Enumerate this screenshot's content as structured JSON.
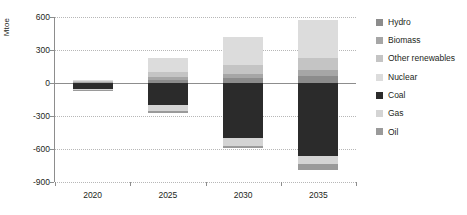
{
  "chart_data": {
    "type": "bar",
    "title": "",
    "subtitle": "",
    "xlabel": "",
    "ylabel": "Mtoe",
    "categories": [
      "2020",
      "2025",
      "2030",
      "2035"
    ],
    "ylim": [
      -900,
      600
    ],
    "yticks": [
      600,
      300,
      0,
      -300,
      -600,
      -900
    ],
    "ytick_labels": [
      "600",
      "300",
      "0",
      "-300",
      "-600",
      "-900"
    ],
    "grid": true,
    "stacked": true,
    "legend_position": "right",
    "series": [
      {
        "name": "Hydro",
        "color": "#8c8c8c",
        "values": [
          4,
          28,
          44,
          62
        ]
      },
      {
        "name": "Biomass",
        "color": "#a6a6a6",
        "values": [
          4,
          26,
          42,
          58
        ]
      },
      {
        "name": "Other renewables",
        "color": "#c4c4c4",
        "values": [
          6,
          42,
          74,
          108
        ]
      },
      {
        "name": "Nuclear",
        "color": "#dcdcdc",
        "values": [
          10,
          128,
          262,
          342
        ]
      },
      {
        "name": "Coal",
        "color": "#2b2b2b",
        "values": [
          -52,
          -200,
          -500,
          -660
        ]
      },
      {
        "name": "Gas",
        "color": "#d4d4d4",
        "values": [
          -8,
          -52,
          -72,
          -80
        ]
      },
      {
        "name": "Oil",
        "color": "#9a9a9a",
        "values": [
          -4,
          -20,
          -22,
          -50
        ]
      }
    ]
  },
  "legend": {
    "items": [
      {
        "label": "Hydro"
      },
      {
        "label": "Biomass"
      },
      {
        "label": "Other renewables"
      },
      {
        "label": "Nuclear"
      },
      {
        "label": "Coal"
      },
      {
        "label": "Gas"
      },
      {
        "label": "Oil"
      }
    ]
  }
}
